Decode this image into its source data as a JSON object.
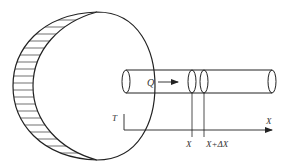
{
  "diagram": {
    "type": "physics-schematic",
    "labels": {
      "flow": "Q",
      "temperature_axis": "T",
      "position_axis": "X",
      "element_start": "X",
      "element_end": "X+ΔX"
    },
    "colors": {
      "stroke": "#222222",
      "text": "#333333",
      "background": "#ffffff"
    }
  }
}
